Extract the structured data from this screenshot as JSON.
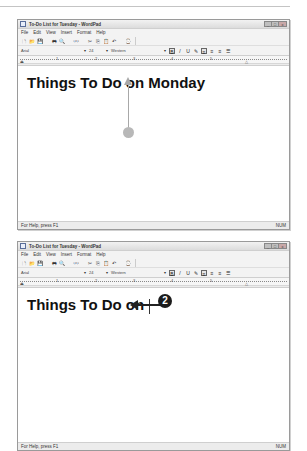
{
  "windows": [
    {
      "title": "To-Do List for Tuesday - WordPad",
      "controls": [
        "_",
        "□",
        "x"
      ],
      "menu": [
        "File",
        "Edit",
        "View",
        "Insert",
        "Format",
        "Help"
      ],
      "toolbar_icons": [
        "new-icon",
        "open-icon",
        "save-icon",
        "print-icon",
        "print-preview-icon",
        "find-icon",
        "cut-icon",
        "copy-icon",
        "paste-icon",
        "undo-icon",
        "date-time-icon"
      ],
      "format": {
        "font": "Arial",
        "size": "24",
        "script": "Western",
        "buttons": [
          "B",
          "/",
          "U",
          "color",
          "left",
          "center",
          "right",
          "bullets"
        ]
      },
      "ruler_numbers": [
        "1",
        "2",
        "3",
        "4",
        "5"
      ],
      "document_text": "Things To Do on Monday",
      "status_left": "For Help, press F1",
      "status_right": "NUM"
    },
    {
      "title": "To-Do List for Tuesday - WordPad",
      "controls": [
        "_",
        "□",
        "x"
      ],
      "menu": [
        "File",
        "Edit",
        "View",
        "Insert",
        "Format",
        "Help"
      ],
      "toolbar_icons": [
        "new-icon",
        "open-icon",
        "save-icon",
        "print-icon",
        "print-preview-icon",
        "find-icon",
        "cut-icon",
        "copy-icon",
        "paste-icon",
        "undo-icon",
        "date-time-icon"
      ],
      "format": {
        "font": "Arial",
        "size": "24",
        "script": "Western",
        "buttons": [
          "B",
          "/",
          "U",
          "color",
          "left",
          "center",
          "right",
          "bullets"
        ]
      },
      "ruler_numbers": [
        "1",
        "2",
        "3",
        "4",
        "5"
      ],
      "document_text": "Things To Do on",
      "status_left": "For Help, press F1",
      "status_right": "NUM"
    }
  ],
  "callouts": {
    "step2_label": "2"
  },
  "glyphs": {
    "new": "🗋",
    "open": "📂",
    "save": "💾",
    "print": "🖶",
    "preview": "🔍",
    "find": "👓",
    "cut": "✂",
    "copy": "⎘",
    "paste": "📋",
    "undo": "↶",
    "datetime": "⌚",
    "dropdown": "▾",
    "bold": "B",
    "italic": "/",
    "underline": "U",
    "color": "✎",
    "align_left": "≡",
    "align_center": "≡",
    "align_right": "≡",
    "bullets": "☰"
  }
}
